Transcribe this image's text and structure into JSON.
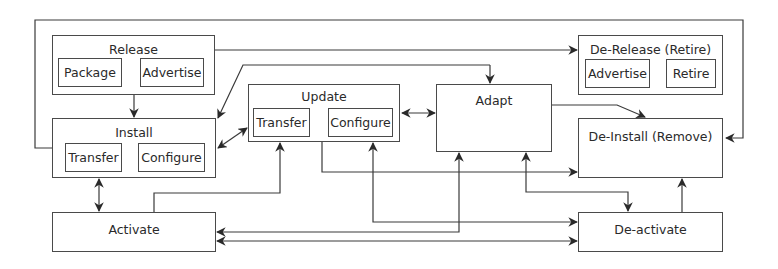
{
  "diagram": {
    "type": "software-lifecycle-activity-diagram",
    "nodes": {
      "release": {
        "label": "Release",
        "steps": [
          "Package",
          "Advertise"
        ]
      },
      "install": {
        "label": "Install",
        "steps": [
          "Transfer",
          "Configure"
        ]
      },
      "update": {
        "label": "Update",
        "steps": [
          "Transfer",
          "Configure"
        ]
      },
      "adapt": {
        "label": "Adapt"
      },
      "de_release": {
        "label": "De-Release (Retire)",
        "steps": [
          "Advertise",
          "Retire"
        ]
      },
      "de_install": {
        "label": "De-Install (Remove)"
      },
      "activate": {
        "label": "Activate"
      },
      "de_activate": {
        "label": "De-activate"
      }
    },
    "edges": [
      {
        "from": "Package",
        "to": "Advertise",
        "direction": "one-way"
      },
      {
        "from": "Install.Transfer",
        "to": "Install.Configure",
        "direction": "one-way"
      },
      {
        "from": "Update.Transfer",
        "to": "Update.Configure",
        "direction": "one-way"
      },
      {
        "from": "De-Release.Advertise",
        "to": "Retire",
        "direction": "one-way"
      },
      {
        "from": "Release",
        "to": "Install",
        "direction": "one-way"
      },
      {
        "from": "Release",
        "to": "De-Release (Retire)",
        "direction": "one-way"
      },
      {
        "from": "Update",
        "to": "Adapt",
        "direction": "one-way",
        "via": "top line into Adapt"
      },
      {
        "from": "Update",
        "to": "Install",
        "direction": "one-way",
        "via": "diagonal from top line"
      },
      {
        "from": "Install",
        "to": "Update",
        "direction": "two-way"
      },
      {
        "from": "Update",
        "to": "Adapt",
        "direction": "two-way"
      },
      {
        "from": "Adapt",
        "to": "De-Install (Remove)",
        "direction": "one-way"
      },
      {
        "from": "Install",
        "to": "Activate",
        "direction": "two-way"
      },
      {
        "from": "Update",
        "to": "De-Install (Remove)",
        "direction": "one-way"
      },
      {
        "from": "Activate",
        "to": "Update",
        "direction": "one-way"
      },
      {
        "from": "De-activate",
        "to": "Update",
        "direction": "one-way"
      },
      {
        "from": "Activate",
        "to": "Adapt",
        "direction": "one-way"
      },
      {
        "from": "Adapt",
        "to": "De-activate",
        "direction": "two-way"
      },
      {
        "from": "Activate",
        "to": "De-activate",
        "direction": "two-way"
      },
      {
        "from": "De-activate",
        "to": "De-Install (Remove)",
        "direction": "one-way"
      },
      {
        "from": "Outer loop",
        "to": "Install",
        "direction": "one-way"
      },
      {
        "from": "Outer loop",
        "to": "De-Install (Remove)",
        "direction": "one-way"
      }
    ]
  },
  "colors": {
    "line": "#3a3a3a",
    "box_border": "#4a4a4a",
    "background": "#ffffff",
    "text": "#2a2a2a"
  }
}
